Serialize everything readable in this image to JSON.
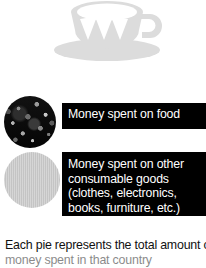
{
  "illustration": {
    "name": "teacup-and-saucer-watermark",
    "color": "#dcdcdc",
    "alt": "teacup on saucer"
  },
  "legend": {
    "items": [
      {
        "swatch": "dark-textured-pie",
        "swatch_color": "#0d0d0d",
        "lines": [
          "Money spent on food"
        ]
      },
      {
        "swatch": "light-gray-pie",
        "swatch_color": "#c4c4c4",
        "lines": [
          "Money spent on other",
          "consumable goods",
          "(clothes, electronics,",
          "books, furniture, etc.)"
        ]
      }
    ]
  },
  "caption": {
    "line1": "Each pie represents the total amount of",
    "line2": "money spent in that country"
  }
}
